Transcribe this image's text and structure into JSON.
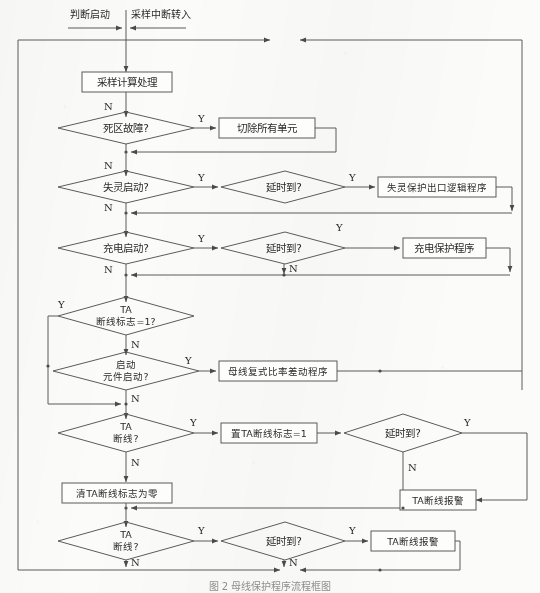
{
  "figure": {
    "title_top_left": "判断启动",
    "title_top_right": "采样中断转入",
    "caption": "图 2 母线保护程序流程框图"
  },
  "colors": {
    "line": "#5b5b5b",
    "text": "#2b2b2b",
    "paper": "#fbfbf9",
    "shape_fill": "#fdfdfb"
  },
  "branch_labels": {
    "yes": "Y",
    "no": "N"
  },
  "nodes": [
    {
      "id": "n1",
      "type": "process",
      "label": "采样计算处理"
    },
    {
      "id": "n2",
      "type": "decision",
      "label": "死区故障?"
    },
    {
      "id": "n3",
      "type": "process",
      "label": "切除所有单元"
    },
    {
      "id": "n4",
      "type": "decision",
      "label": "失灵启动?"
    },
    {
      "id": "n5",
      "type": "decision",
      "label": "延时到?"
    },
    {
      "id": "n6",
      "type": "process",
      "label": "失灵保护出口逻辑程序"
    },
    {
      "id": "n7",
      "type": "decision",
      "label": "充电启动?"
    },
    {
      "id": "n8",
      "type": "decision",
      "label": "延时到?"
    },
    {
      "id": "n9",
      "type": "process",
      "label": "充电保护程序"
    },
    {
      "id": "n10",
      "type": "decision",
      "label_line1": "TA",
      "label_line2": "断线标志=1?"
    },
    {
      "id": "n11",
      "type": "decision",
      "label_line1": "启动",
      "label_line2": "元件启动?"
    },
    {
      "id": "n12",
      "type": "process",
      "label": "母线复式比率差动程序"
    },
    {
      "id": "n13",
      "type": "decision",
      "label_line1": "TA",
      "label_line2": "断线?"
    },
    {
      "id": "n14",
      "type": "process",
      "label": "置TA断线标志=1"
    },
    {
      "id": "n15",
      "type": "decision",
      "label": "延时到?"
    },
    {
      "id": "n16",
      "type": "process",
      "label": "清TA断线标志为零"
    },
    {
      "id": "n17",
      "type": "process",
      "label": "TA断线报警"
    },
    {
      "id": "n18",
      "type": "decision",
      "label_line1": "TA",
      "label_line2": "断线?"
    },
    {
      "id": "n19",
      "type": "decision",
      "label": "延时到?"
    },
    {
      "id": "n20",
      "type": "process",
      "label": "TA断线报警"
    }
  ]
}
